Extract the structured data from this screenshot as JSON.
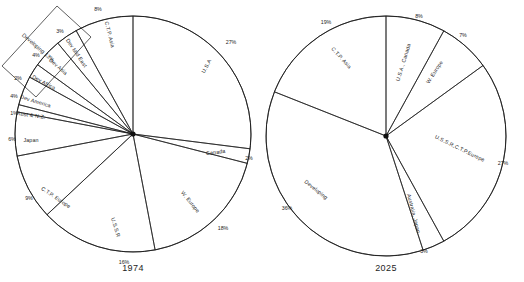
{
  "figure": {
    "background": "#ffffff",
    "stroke_color": "#1a1a1a",
    "charts": [
      {
        "id": "pie-1974",
        "year_label": "1974",
        "center": [
          133,
          134
        ],
        "radius": 118,
        "year_pos": [
          133,
          271
        ],
        "slices": [
          {
            "name": "U.S.A",
            "label": "U.S.A",
            "pct": 27,
            "pct_label": "27%",
            "label_pos": [
              208,
              67
            ],
            "label_rot": 62,
            "pct_pos": [
              231,
              44
            ]
          },
          {
            "name": "Canada",
            "label": "Canada",
            "pct": 2,
            "pct_label": "2%",
            "label_pos": [
              216,
              154
            ],
            "label_rot": 8,
            "pct_pos": [
              249,
              160
            ]
          },
          {
            "name": "W. Europe",
            "label": "W. Europe",
            "pct": 18,
            "pct_label": "18%",
            "label_pos": [
              189,
              203
            ],
            "label_rot": -51,
            "pct_pos": [
              223,
              230
            ]
          },
          {
            "name": "U.S.S.R",
            "label": "U.S.S.R",
            "pct": 16,
            "pct_label": "16%",
            "label_pos": [
              114,
              228
            ],
            "label_rot": -73,
            "pct_pos": [
              124,
              264
            ]
          },
          {
            "name": "C.T.P. Europe",
            "label": "C.T.P. Europe",
            "pct": 9,
            "pct_label": "9%",
            "label_pos": [
              55,
              199
            ],
            "label_rot": -34,
            "pct_pos": [
              29,
              200
            ]
          },
          {
            "name": "Japan",
            "label": "Japan",
            "pct": 6,
            "pct_label": "6%",
            "label_pos": [
              31,
              142
            ],
            "label_rot": 0,
            "pct_pos": [
              12,
              141
            ]
          },
          {
            "name": "Aust & N.Z.",
            "label": "Aust & N.Z.",
            "pct": 1,
            "pct_label": "1%",
            "label_pos": [
              31,
              117
            ],
            "label_rot": -8,
            "pct_pos": [
              14,
              115
            ]
          },
          {
            "name": "Dev America",
            "label": "Dev America",
            "pct": 4,
            "pct_label": "4%",
            "label_pos": [
              35,
              103
            ],
            "label_rot": -17,
            "pct_pos": [
              14,
              98
            ]
          },
          {
            "name": "Dev Africa",
            "label": "Dev Africa",
            "pct": 2,
            "pct_label": "2%",
            "label_pos": [
              43,
              84
            ],
            "label_rot": -28,
            "pct_pos": [
              18,
              80
            ]
          },
          {
            "name": "Dev Asia",
            "label": "Dev Asia",
            "pct": 4,
            "pct_label": "4%",
            "label_pos": [
              57,
              68
            ],
            "label_rot": -41,
            "pct_pos": [
              36,
              57
            ]
          },
          {
            "name": "Dev Mid East",
            "label": "Dev Mid East",
            "pct": 3,
            "pct_label": "3%",
            "label_pos": [
              75,
              54
            ],
            "label_rot": -56,
            "pct_pos": [
              60,
              33
            ]
          },
          {
            "name": "C.T.P. Asia",
            "label": "C.T.P. Asia",
            "pct": 8,
            "pct_label": "8%",
            "label_pos": [
              108,
              35
            ],
            "label_rot": -76,
            "pct_pos": [
              98,
              11
            ]
          }
        ],
        "group": {
          "label": "Developing 13%",
          "label_pos": [
            37,
            49
          ],
          "label_rot": -41,
          "bracket": "M 2,66 L 57,6 L 91,37 L 36,97 Z"
        }
      },
      {
        "id": "pie-2025",
        "year_label": "2025",
        "center": [
          386,
          136
        ],
        "radius": 120,
        "year_pos": [
          386,
          271
        ],
        "slices": [
          {
            "name": "U.S.A., Canada",
            "label": "U.S.A., Canada",
            "pct": 8,
            "pct_label": "8%",
            "label_pos": [
              405,
              63
            ],
            "label_rot": 73,
            "pct_pos": [
              419,
              18
            ]
          },
          {
            "name": "W. Europe",
            "label": "W. Europe",
            "pct": 7,
            "pct_label": "7%",
            "label_pos": [
              436,
              73
            ],
            "label_rot": 57,
            "pct_pos": [
              463,
              37
            ]
          },
          {
            "name": "U.S.S.R, C.T.P. Europe",
            "label": "U.S.S.R,C.T.P.Europe",
            "pct": 27,
            "pct_label": "27%",
            "label_pos": [
              459,
              150
            ],
            "label_rot": -26,
            "pct_pos": [
              503,
              165
            ]
          },
          {
            "name": "Australia, Japan",
            "label": "Australia, Japan",
            "pct": 3,
            "pct_label": "3%",
            "label_pos": [
              412,
              214
            ],
            "label_rot": -76,
            "pct_pos": [
              424,
              253
            ]
          },
          {
            "name": "Developing",
            "label": "Developing",
            "pct": 36,
            "pct_label": "36%",
            "label_pos": [
              315,
              191
            ],
            "label_rot": -39,
            "pct_pos": [
              287,
              210
            ]
          },
          {
            "name": "C.T.P. Asia",
            "label": "C.T.P. Asia",
            "pct": 19,
            "pct_label": "19%",
            "label_pos": [
              340,
              59
            ],
            "label_rot": -48,
            "pct_pos": [
              326,
              24
            ]
          }
        ]
      }
    ]
  },
  "chart_data": [
    {
      "type": "pie",
      "title": "1974",
      "categories": [
        "U.S.A",
        "Canada",
        "W. Europe",
        "U.S.S.R",
        "C.T.P. Europe",
        "Japan",
        "Aust & N.Z.",
        "Dev America",
        "Dev Africa",
        "Dev Asia",
        "Dev Mid East",
        "C.T.P. Asia"
      ],
      "values": [
        27,
        2,
        18,
        16,
        9,
        6,
        1,
        4,
        2,
        4,
        3,
        8
      ],
      "unit": "%",
      "annotations": [
        "Developing 13%"
      ],
      "legend": "none",
      "grid": false,
      "xlabel": "",
      "ylabel": ""
    },
    {
      "type": "pie",
      "title": "2025",
      "categories": [
        "U.S.A., Canada",
        "W. Europe",
        "U.S.S.R, C.T.P. Europe",
        "Australia, Japan",
        "Developing",
        "C.T.P. Asia"
      ],
      "values": [
        8,
        7,
        27,
        3,
        36,
        19
      ],
      "unit": "%",
      "annotations": [],
      "legend": "none",
      "grid": false,
      "xlabel": "",
      "ylabel": ""
    }
  ]
}
